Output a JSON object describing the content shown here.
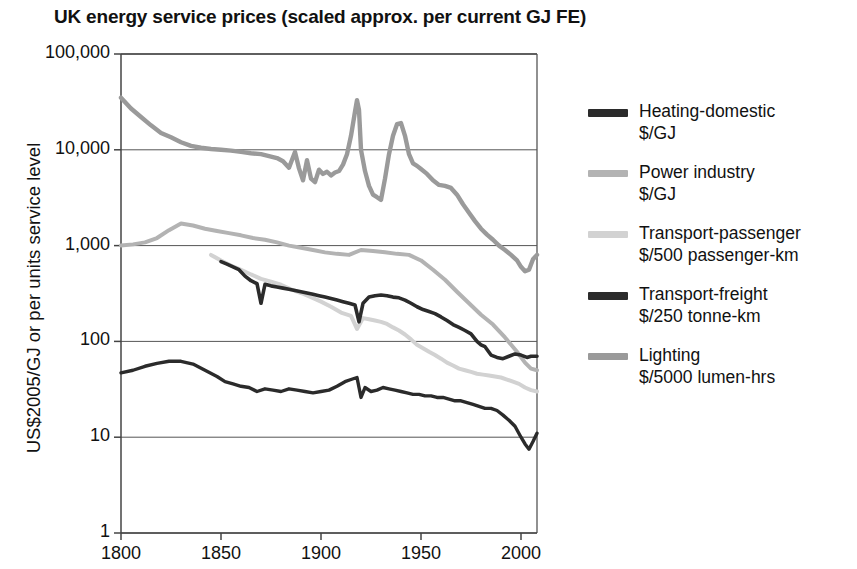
{
  "chart_data": {
    "type": "line",
    "title": "UK energy service prices (scaled approx. per current GJ FE)",
    "xlabel": "",
    "ylabel": "US$2005/GJ or per units service level",
    "yscale": "log",
    "ylim": [
      1,
      100000
    ],
    "xlim": [
      1800,
      2008
    ],
    "grid": true,
    "legend_position": "right",
    "ytick_labels": [
      "100,000",
      "10,000",
      "1,000",
      "100",
      "10",
      "1"
    ],
    "ytick_values": [
      100000,
      10000,
      1000,
      100,
      10,
      1
    ],
    "xtick_labels": [
      "1800",
      "1850",
      "1900",
      "1950",
      "2000"
    ],
    "xtick_values": [
      1800,
      1850,
      1900,
      1950,
      2000
    ],
    "series": [
      {
        "name": "Heating-domestic",
        "unit": "$/GJ",
        "color": "#2b2b2b",
        "width": 3.6,
        "x": [
          1850,
          1853,
          1856,
          1859,
          1862,
          1865,
          1868,
          1870,
          1872,
          1875,
          1878,
          1881,
          1884,
          1887,
          1890,
          1893,
          1896,
          1899,
          1902,
          1905,
          1908,
          1911,
          1914,
          1917,
          1919,
          1921,
          1924,
          1927,
          1930,
          1933,
          1936,
          1939,
          1942,
          1945,
          1948,
          1951,
          1954,
          1957,
          1960,
          1963,
          1966,
          1969,
          1972,
          1975,
          1978,
          1980,
          1982,
          1985,
          1988,
          1991,
          1994,
          1997,
          2000,
          2003,
          2005,
          2008
        ],
        "y": [
          680,
          640,
          600,
          560,
          480,
          430,
          400,
          250,
          395,
          380,
          370,
          360,
          350,
          340,
          330,
          320,
          310,
          300,
          290,
          280,
          270,
          260,
          250,
          240,
          160,
          250,
          290,
          300,
          305,
          300,
          290,
          285,
          270,
          250,
          230,
          215,
          205,
          195,
          180,
          165,
          150,
          140,
          130,
          120,
          100,
          92,
          88,
          72,
          68,
          66,
          70,
          74,
          72,
          68,
          70,
          70
        ]
      },
      {
        "name": "Power industry",
        "unit": "$/GJ",
        "color": "#b3b3b3",
        "width": 4.0,
        "x": [
          1800,
          1806,
          1812,
          1818,
          1824,
          1830,
          1836,
          1842,
          1848,
          1854,
          1860,
          1866,
          1872,
          1878,
          1884,
          1890,
          1896,
          1902,
          1908,
          1914,
          1920,
          1926,
          1932,
          1938,
          1944,
          1950,
          1956,
          1962,
          1968,
          1974,
          1980,
          1986,
          1992,
          1998,
          2002,
          2005,
          2008
        ],
        "y": [
          1000,
          1030,
          1080,
          1200,
          1450,
          1700,
          1620,
          1500,
          1420,
          1350,
          1280,
          1200,
          1150,
          1080,
          1000,
          950,
          900,
          850,
          820,
          800,
          900,
          880,
          850,
          820,
          800,
          700,
          560,
          440,
          330,
          250,
          190,
          150,
          110,
          78,
          60,
          52,
          50
        ]
      },
      {
        "name": "Transport-passenger",
        "unit": "$/500 passenger-km",
        "color": "#d2d2d2",
        "width": 4.0,
        "x": [
          1845,
          1850,
          1855,
          1860,
          1865,
          1870,
          1875,
          1880,
          1885,
          1890,
          1895,
          1900,
          1905,
          1910,
          1915,
          1918,
          1921,
          1924,
          1927,
          1930,
          1933,
          1936,
          1939,
          1942,
          1945,
          1948,
          1951,
          1954,
          1957,
          1960,
          1963,
          1966,
          1969,
          1972,
          1975,
          1978,
          1981,
          1984,
          1987,
          1990,
          1993,
          1996,
          1999,
          2002,
          2005,
          2008
        ],
        "y": [
          800,
          700,
          620,
          560,
          500,
          450,
          420,
          390,
          350,
          320,
          290,
          260,
          230,
          200,
          185,
          135,
          175,
          170,
          165,
          160,
          152,
          140,
          130,
          118,
          105,
          92,
          85,
          78,
          72,
          66,
          60,
          56,
          52,
          50,
          48,
          46,
          45,
          44,
          43,
          42,
          40,
          38,
          36,
          33,
          31,
          30
        ]
      },
      {
        "name": "Transport-freight",
        "unit": "$/250 tonne-km",
        "color": "#2b2b2b",
        "width": 3.4,
        "x": [
          1800,
          1806,
          1812,
          1818,
          1824,
          1830,
          1836,
          1842,
          1848,
          1852,
          1856,
          1860,
          1864,
          1868,
          1872,
          1876,
          1880,
          1884,
          1888,
          1892,
          1896,
          1900,
          1904,
          1908,
          1912,
          1915,
          1918,
          1920,
          1922,
          1925,
          1928,
          1931,
          1934,
          1937,
          1940,
          1943,
          1946,
          1949,
          1952,
          1955,
          1958,
          1961,
          1964,
          1967,
          1970,
          1973,
          1976,
          1979,
          1982,
          1985,
          1988,
          1991,
          1994,
          1997,
          2000,
          2002,
          2004,
          2006,
          2008
        ],
        "y": [
          47,
          50,
          55,
          59,
          62,
          62,
          58,
          50,
          43,
          38,
          36,
          34,
          33,
          30,
          32,
          31,
          30,
          32,
          31,
          30,
          29,
          30,
          31,
          34,
          38,
          40,
          42,
          26,
          33,
          30,
          31,
          33,
          32,
          31,
          30,
          29,
          28,
          28,
          27,
          27,
          26,
          26,
          25,
          24,
          24,
          23,
          22,
          21,
          20,
          20,
          19,
          17,
          15,
          13,
          10,
          8.5,
          7.5,
          9,
          11
        ]
      },
      {
        "name": "Lighting",
        "unit": "$/5000 lumen-hrs",
        "color": "#9a9a9a",
        "width": 4.4,
        "x": [
          1800,
          1805,
          1810,
          1815,
          1820,
          1825,
          1830,
          1835,
          1840,
          1845,
          1850,
          1855,
          1860,
          1865,
          1870,
          1874,
          1878,
          1881,
          1884,
          1887,
          1889,
          1891,
          1893,
          1895,
          1897,
          1899,
          1901,
          1903,
          1905,
          1907,
          1909,
          1911,
          1913,
          1915,
          1917,
          1918,
          1919,
          1920,
          1922,
          1924,
          1926,
          1928,
          1930,
          1932,
          1934,
          1936,
          1938,
          1940,
          1942,
          1944,
          1946,
          1948,
          1950,
          1953,
          1956,
          1959,
          1962,
          1965,
          1968,
          1971,
          1974,
          1977,
          1980,
          1983,
          1986,
          1989,
          1992,
          1995,
          1998,
          2000,
          2002,
          2004,
          2006,
          2008
        ],
        "y": [
          35000,
          27000,
          22000,
          18000,
          15000,
          13500,
          12000,
          11000,
          10500,
          10200,
          10000,
          9800,
          9500,
          9200,
          9000,
          8600,
          8200,
          7600,
          6500,
          9500,
          6400,
          4800,
          7800,
          5000,
          4600,
          6200,
          5600,
          5900,
          5400,
          5800,
          6000,
          7000,
          9000,
          14000,
          25000,
          33000,
          26000,
          10000,
          6000,
          4200,
          3400,
          3200,
          3000,
          5000,
          9000,
          14000,
          18500,
          19000,
          14000,
          9000,
          7200,
          6800,
          6300,
          5600,
          4800,
          4300,
          4200,
          4000,
          3400,
          2700,
          2200,
          1800,
          1500,
          1300,
          1150,
          1000,
          900,
          800,
          700,
          600,
          540,
          560,
          720,
          800
        ]
      }
    ]
  },
  "legend": {
    "items": [
      {
        "label": "Heating-domestic",
        "unit": "$/GJ",
        "color": "#2b2b2b",
        "thickness": 8
      },
      {
        "label": "Power industry",
        "unit": "$/GJ",
        "color": "#b3b3b3",
        "thickness": 7
      },
      {
        "label": "Transport-passenger",
        "unit": "$/500 passenger-km",
        "color": "#d2d2d2",
        "thickness": 7
      },
      {
        "label": "Transport-freight",
        "unit": "$/250 tonne-km",
        "color": "#2b2b2b",
        "thickness": 8
      },
      {
        "label": "Lighting",
        "unit": "$/5000 lumen-hrs",
        "color": "#9a9a9a",
        "thickness": 7
      }
    ]
  },
  "axes": {
    "plot_left": 121,
    "plot_right": 537,
    "plot_top": 54,
    "plot_bottom": 533
  }
}
